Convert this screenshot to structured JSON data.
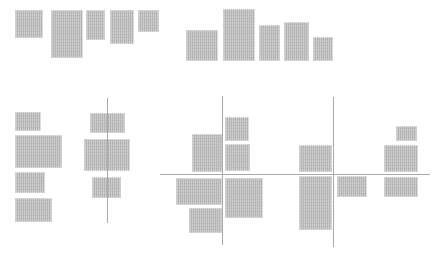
{
  "figure": {
    "canvas": {
      "width": 441,
      "height": 257,
      "background": "#ffffff"
    },
    "style": {
      "bar_fill": "#c6c6c6",
      "bar_stripe_dark": "#b9b9b9",
      "bar_stripe_light": "#cdcdcd",
      "axis_line_color": "#a9a9a9",
      "axis_line_thickness": 1
    },
    "groups": [
      {
        "name": "top-aligned-row",
        "description": "five bars hanging from a common top edge",
        "rects": [
          {
            "x": 15,
            "y": 10,
            "w": 28,
            "h": 28
          },
          {
            "x": 51,
            "y": 10,
            "w": 32,
            "h": 48
          },
          {
            "x": 86,
            "y": 10,
            "w": 19,
            "h": 30
          },
          {
            "x": 110,
            "y": 10,
            "w": 24,
            "h": 34
          },
          {
            "x": 138,
            "y": 10,
            "w": 21,
            "h": 22
          }
        ]
      },
      {
        "name": "bottom-aligned-row",
        "description": "five bars standing on a common baseline",
        "rects": [
          {
            "x": 186,
            "y": 30,
            "w": 32,
            "h": 31
          },
          {
            "x": 223,
            "y": 9,
            "w": 32,
            "h": 52
          },
          {
            "x": 259,
            "y": 25,
            "w": 21,
            "h": 36
          },
          {
            "x": 284,
            "y": 22,
            "w": 25,
            "h": 39
          },
          {
            "x": 313,
            "y": 37,
            "w": 20,
            "h": 24
          }
        ]
      },
      {
        "name": "left-aligned-stack",
        "description": "four bars stacked vertically, flush left",
        "rects": [
          {
            "x": 15,
            "y": 112,
            "w": 26,
            "h": 19
          },
          {
            "x": 15,
            "y": 135,
            "w": 47,
            "h": 33
          },
          {
            "x": 15,
            "y": 172,
            "w": 30,
            "h": 21
          },
          {
            "x": 15,
            "y": 198,
            "w": 37,
            "h": 24
          }
        ]
      },
      {
        "name": "center-aligned-stack",
        "description": "three bars centered on a vertical line",
        "rects": [
          {
            "x": 90,
            "y": 113,
            "w": 35,
            "h": 20
          },
          {
            "x": 84,
            "y": 139,
            "w": 46,
            "h": 32
          },
          {
            "x": 92,
            "y": 177,
            "w": 29,
            "h": 21
          }
        ]
      },
      {
        "name": "cross-quadrant-middle",
        "description": "six bars arranged around crossing axes",
        "rects": [
          {
            "x": 192,
            "y": 134,
            "w": 31,
            "h": 38
          },
          {
            "x": 225,
            "y": 117,
            "w": 24,
            "h": 24
          },
          {
            "x": 225,
            "y": 144,
            "w": 25,
            "h": 27
          },
          {
            "x": 176,
            "y": 178,
            "w": 46,
            "h": 27
          },
          {
            "x": 189,
            "y": 208,
            "w": 33,
            "h": 25
          },
          {
            "x": 225,
            "y": 178,
            "w": 38,
            "h": 40
          }
        ]
      },
      {
        "name": "cross-quadrant-right",
        "description": "three bars around the right vertical axis",
        "rects": [
          {
            "x": 299,
            "y": 145,
            "w": 33,
            "h": 27
          },
          {
            "x": 299,
            "y": 176,
            "w": 33,
            "h": 54
          },
          {
            "x": 337,
            "y": 176,
            "w": 30,
            "h": 21
          }
        ]
      },
      {
        "name": "right-edge-stack",
        "description": "three bars straddling the horizontal axis at far right",
        "rects": [
          {
            "x": 396,
            "y": 126,
            "w": 21,
            "h": 15
          },
          {
            "x": 384,
            "y": 145,
            "w": 34,
            "h": 27
          },
          {
            "x": 384,
            "y": 177,
            "w": 34,
            "h": 20
          }
        ]
      }
    ],
    "lines": [
      {
        "name": "horizontal-axis",
        "orientation": "horizontal",
        "x1": 160,
        "x2": 430,
        "y": 174
      },
      {
        "name": "vertical-axis-left",
        "orientation": "vertical",
        "x": 107,
        "y1": 98,
        "y2": 223
      },
      {
        "name": "vertical-axis-middle",
        "orientation": "vertical",
        "x": 222,
        "y1": 96,
        "y2": 245
      },
      {
        "name": "vertical-axis-right",
        "orientation": "vertical",
        "x": 333,
        "y1": 97,
        "y2": 247
      }
    ]
  }
}
